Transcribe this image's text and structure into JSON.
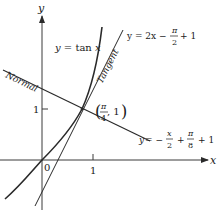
{
  "figure": {
    "axes": {
      "x_label": "x",
      "y_label": "y",
      "origin_label": "0",
      "x_tick_label": "1",
      "y_tick_label": "1"
    },
    "curves": {
      "tan": {
        "label": "y = tan x"
      },
      "tangent": {
        "name": "Tangent",
        "eq_prefix": "y = 2x −",
        "eq_frac_num": "π",
        "eq_frac_den": "2",
        "eq_suffix": "+ 1"
      },
      "normal": {
        "name": "Normal",
        "eq_prefix": "y = −",
        "eq_frac1_num": "x",
        "eq_frac1_den": "2",
        "eq_plus": "+",
        "eq_frac2_num": "π",
        "eq_frac2_den": "8",
        "eq_suffix": "+ 1"
      }
    },
    "point": {
      "frac_num": "π",
      "frac_den": "4",
      "y_value": ", 1"
    },
    "colors": {
      "curve": "#2a2a2a",
      "axis": "#3a3a3a",
      "text": "#1a1a1a"
    }
  }
}
